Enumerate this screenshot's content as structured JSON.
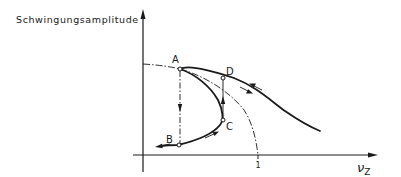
{
  "diagram": {
    "y_axis_label": "Schwingungsamplitude",
    "x_axis_label": "ν",
    "x_axis_label_subscript": "Z",
    "x_tick_label": "1",
    "points": {
      "A": "A",
      "B": "B",
      "C": "C",
      "D": "D"
    },
    "ink_color": "#1a1a1a",
    "curves": [
      {
        "name": "response-curve",
        "style": "solid-thick",
        "description": "Hysteresis response curve from B through C up to A, then over the top through D, decaying to the right"
      },
      {
        "name": "backbone-curve",
        "style": "dash-dot",
        "description": "Backbone curve starting on y-axis, passing through A, dropping to x = 1"
      },
      {
        "name": "jump-down-A-B",
        "style": "dash-dot-with-arrow",
        "description": "Vertical jump from A down to B"
      },
      {
        "name": "jump-up-C-D",
        "style": "solid-with-arrow",
        "description": "Vertical jump from C up to D"
      }
    ]
  }
}
